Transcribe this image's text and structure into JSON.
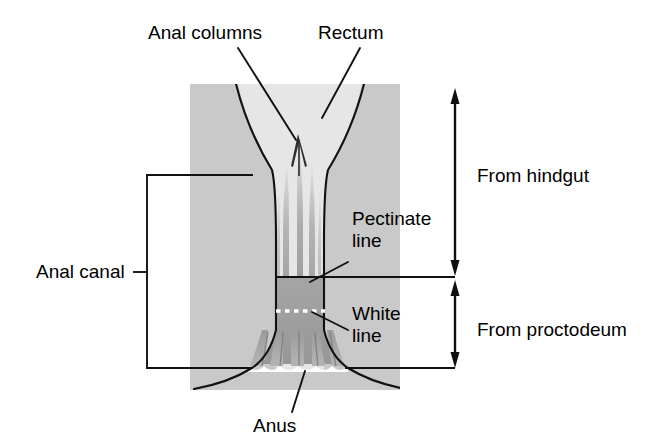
{
  "figure": {
    "type": "anatomical-diagram"
  },
  "labels": {
    "anal_columns": "Anal columns",
    "rectum": "Rectum",
    "pectinate_line": "Pectinate\nline",
    "white_line": "White\nline",
    "anal_canal": "Anal canal",
    "from_hindgut": "From hindgut",
    "from_proctodeum": "From proctodeum",
    "anus": "Anus"
  },
  "regions": [
    {
      "name": "rectum",
      "origin": "hindgut",
      "shading": "light-gray"
    },
    {
      "name": "anal-canal-upper",
      "origin": "hindgut",
      "shading": "light-gray"
    },
    {
      "name": "anal-canal-lower",
      "origin": "proctodeum",
      "shading": "medium-gray"
    },
    {
      "name": "surrounding-tissue",
      "origin": "",
      "shading": "gray"
    }
  ],
  "markers": {
    "pectinate_line_style": "solid-black-horizontal",
    "white_line_style": "white-dotted-horizontal",
    "anal_canal_bracket_style": "rectangular-bracket-open-right",
    "hindgut_arrow_style": "double-headed-vertical-arrow",
    "proctodeum_arrow_style": "double-headed-vertical-arrow"
  },
  "colors": {
    "background": "#ffffff",
    "outer_tissue_gray": "#c9c9c9",
    "lumen_light_gray": "#e6e6e6",
    "canal_mid_gray": "#a8a8a8",
    "canal_dark_gray": "#8f8f8f",
    "line_black": "#000000",
    "white_line": "#ffffff"
  },
  "geometry": {
    "gray_block": {
      "x": 190,
      "y": 84,
      "width": 210,
      "height": 306
    },
    "pectinate_line_y": 277,
    "white_line_y": 311,
    "anus_base_y": 368,
    "hindgut_arrow": {
      "x": 455,
      "y_top": 90,
      "y_bottom": 274
    },
    "proctodeum_arrow": {
      "x": 455,
      "y_top": 281,
      "y_bottom": 367
    },
    "anal_canal_bracket": {
      "x_left": 147,
      "x_right": 253,
      "y_top": 175,
      "y_bottom": 368,
      "tick_y": 272
    }
  }
}
